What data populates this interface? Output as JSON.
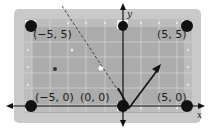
{
  "diagram": {
    "type": "coordinate-plane billiard table",
    "axes": {
      "x_label": "x",
      "y_label": "y"
    },
    "pockets": [
      {
        "label": "(−5, 5)",
        "x": -5,
        "y": 5
      },
      {
        "label": "(5, 5)",
        "x": 5,
        "y": 5
      },
      {
        "label": "(−5, 0)",
        "x": -5,
        "y": 0
      },
      {
        "label": "(0, 0)",
        "x": 0,
        "y": 0
      },
      {
        "label": "(5, 0)",
        "x": 5,
        "y": 0
      }
    ],
    "paths": [
      {
        "style": "dashed",
        "description": "incoming ball path from upper left toward the x-axis"
      },
      {
        "style": "solid-arrow",
        "description": "reflected path bouncing off x-axis up and to the right"
      }
    ],
    "colors": {
      "frame": "#c9c9c9",
      "felt": "#a9a9a9",
      "grid": "#d4d4d4",
      "pocket": "#111111",
      "path": "#1a1a1a"
    }
  }
}
